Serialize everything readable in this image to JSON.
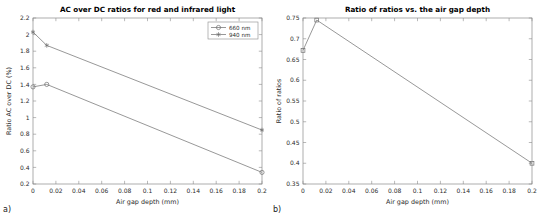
{
  "figure": {
    "panel_a_label": "a)",
    "panel_b_label": "b)"
  },
  "chart_data": [
    {
      "type": "line",
      "panel": "a",
      "title": "AC over DC ratios for red and infrared light",
      "xlabel": "Air gap depth (mm)",
      "ylabel": "Ratio AC over DC (%)",
      "xlim": [
        0,
        0.2
      ],
      "ylim": [
        0.2,
        2.2
      ],
      "xticks": [
        0,
        0.02,
        0.04,
        0.06,
        0.08,
        0.1,
        0.12,
        0.14,
        0.16,
        0.18,
        0.2
      ],
      "xticklabels": [
        "0",
        "0.02",
        "0.04",
        "0.06",
        "0.08",
        "0.1",
        "0.12",
        "0.14",
        "0.16",
        "0.18",
        "0.2"
      ],
      "yticks": [
        0.2,
        0.4,
        0.6,
        0.8,
        1.0,
        1.2,
        1.4,
        1.6,
        1.8,
        2.0,
        2.2
      ],
      "yticklabels": [
        "0.2",
        "0.4",
        "0.6",
        "0.8",
        "1",
        "1.2",
        "1.4",
        "1.6",
        "1.8",
        "2",
        "2.2"
      ],
      "grid": false,
      "legend_position": "upper-right",
      "series": [
        {
          "name": "660 nm",
          "marker": "circle",
          "x": [
            0,
            0.012,
            0.2
          ],
          "values": [
            1.37,
            1.4,
            0.34
          ]
        },
        {
          "name": "940 nm",
          "marker": "asterisk",
          "x": [
            0,
            0.012,
            0.2
          ],
          "values": [
            2.03,
            1.87,
            0.85
          ]
        }
      ]
    },
    {
      "type": "line",
      "panel": "b",
      "title": "Ratio of ratios vs. the air gap depth",
      "xlabel": "Air gap depth (mm)",
      "ylabel": "Ratio of ratios",
      "xlim": [
        0,
        0.2
      ],
      "ylim": [
        0.35,
        0.75
      ],
      "xticks": [
        0,
        0.02,
        0.04,
        0.06,
        0.08,
        0.1,
        0.12,
        0.14,
        0.16,
        0.18,
        0.2
      ],
      "xticklabels": [
        "0",
        "0.02",
        "0.04",
        "0.06",
        "0.08",
        "0.1",
        "0.12",
        "0.14",
        "0.16",
        "0.18",
        "0.2"
      ],
      "yticks": [
        0.35,
        0.4,
        0.45,
        0.5,
        0.55,
        0.6,
        0.65,
        0.7,
        0.75
      ],
      "yticklabels": [
        "0.35",
        "0.4",
        "0.45",
        "0.5",
        "0.55",
        "0.6",
        "0.65",
        "0.7",
        "0.75"
      ],
      "grid": false,
      "legend_position": "none",
      "series": [
        {
          "name": "Ratio of ratios",
          "marker": "square",
          "x": [
            0,
            0.012,
            0.2
          ],
          "values": [
            0.672,
            0.745,
            0.4
          ]
        }
      ]
    }
  ],
  "colors": {
    "line": "#7d7d7d",
    "frame": "#8a8a8a",
    "text": "#2b2b2b",
    "background": "#ffffff"
  }
}
